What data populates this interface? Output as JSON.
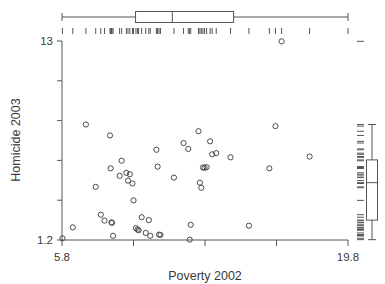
{
  "chart_data": {
    "type": "scatter",
    "title": "",
    "xlabel": "Poverty 2002",
    "ylabel": "Homicide 2003",
    "xlim": [
      5.8,
      19.8
    ],
    "ylim": [
      1.2,
      13.0
    ],
    "xticklabels": [
      "5.8",
      "19.8"
    ],
    "yticklabels": [
      "13",
      "1.2"
    ],
    "grid": false,
    "legend": null,
    "marker": "open-circle",
    "marker_color": "#4a4a4a",
    "points": [
      {
        "x": 5.82,
        "y": 1.3
      },
      {
        "x": 6.33,
        "y": 1.95
      },
      {
        "x": 6.97,
        "y": 8.05
      },
      {
        "x": 7.45,
        "y": 4.35
      },
      {
        "x": 7.7,
        "y": 2.7
      },
      {
        "x": 7.88,
        "y": 2.35
      },
      {
        "x": 8.15,
        "y": 7.4
      },
      {
        "x": 8.18,
        "y": 5.45
      },
      {
        "x": 8.22,
        "y": 2.25
      },
      {
        "x": 8.25,
        "y": 2.22
      },
      {
        "x": 8.3,
        "y": 1.45
      },
      {
        "x": 8.62,
        "y": 5.0
      },
      {
        "x": 8.72,
        "y": 5.9
      },
      {
        "x": 8.95,
        "y": 5.18
      },
      {
        "x": 9.03,
        "y": 4.72
      },
      {
        "x": 9.12,
        "y": 5.1
      },
      {
        "x": 9.25,
        "y": 4.55
      },
      {
        "x": 9.3,
        "y": 3.55
      },
      {
        "x": 9.42,
        "y": 1.9
      },
      {
        "x": 9.5,
        "y": 1.82
      },
      {
        "x": 9.55,
        "y": 1.78
      },
      {
        "x": 9.7,
        "y": 2.55
      },
      {
        "x": 9.9,
        "y": 1.62
      },
      {
        "x": 10.05,
        "y": 2.38
      },
      {
        "x": 10.12,
        "y": 1.45
      },
      {
        "x": 10.42,
        "y": 6.55
      },
      {
        "x": 10.48,
        "y": 5.55
      },
      {
        "x": 10.55,
        "y": 1.52
      },
      {
        "x": 10.62,
        "y": 1.5
      },
      {
        "x": 11.28,
        "y": 4.9
      },
      {
        "x": 11.75,
        "y": 6.95
      },
      {
        "x": 11.98,
        "y": 6.6
      },
      {
        "x": 12.05,
        "y": 1.22
      },
      {
        "x": 12.1,
        "y": 2.1
      },
      {
        "x": 12.48,
        "y": 7.65
      },
      {
        "x": 12.55,
        "y": 4.6
      },
      {
        "x": 12.62,
        "y": 4.3
      },
      {
        "x": 12.7,
        "y": 5.5
      },
      {
        "x": 12.78,
        "y": 5.48
      },
      {
        "x": 12.88,
        "y": 5.52
      },
      {
        "x": 13.05,
        "y": 7.05
      },
      {
        "x": 13.15,
        "y": 6.28
      },
      {
        "x": 13.35,
        "y": 6.35
      },
      {
        "x": 14.05,
        "y": 6.1
      },
      {
        "x": 14.95,
        "y": 2.05
      },
      {
        "x": 15.95,
        "y": 5.45
      },
      {
        "x": 16.25,
        "y": 7.95
      },
      {
        "x": 16.55,
        "y": 12.98
      },
      {
        "x": 17.92,
        "y": 6.15
      }
    ],
    "x_marginal_boxplot": {
      "orientation": "horizontal",
      "whisker_low": 5.8,
      "q1": 9.4,
      "median": 11.2,
      "q3": 14.2,
      "whisker_high": 19.8,
      "rug_values": [
        5.82,
        6.33,
        6.97,
        7.45,
        7.7,
        7.88,
        8.15,
        8.18,
        8.22,
        8.25,
        8.3,
        8.62,
        8.72,
        8.95,
        9.03,
        9.12,
        9.25,
        9.3,
        9.42,
        9.5,
        9.55,
        9.7,
        9.9,
        10.05,
        10.12,
        10.42,
        10.48,
        10.55,
        10.62,
        11.28,
        11.75,
        11.98,
        12.05,
        12.1,
        12.48,
        12.55,
        12.62,
        12.7,
        12.78,
        12.88,
        13.05,
        13.15,
        13.35,
        14.05,
        14.95,
        15.95,
        16.25,
        16.55,
        17.92,
        19.8
      ]
    },
    "y_marginal_boxplot": {
      "orientation": "vertical",
      "whisker_low": 1.22,
      "q1": 2.38,
      "median": 4.6,
      "q3": 5.95,
      "whisker_high": 8.05,
      "rug_values": [
        1.22,
        1.3,
        1.45,
        1.45,
        1.5,
        1.52,
        1.62,
        1.78,
        1.82,
        1.9,
        1.95,
        2.05,
        2.1,
        2.22,
        2.25,
        2.35,
        2.38,
        2.55,
        2.7,
        3.55,
        4.3,
        4.35,
        4.55,
        4.6,
        4.72,
        4.9,
        5.0,
        5.1,
        5.18,
        5.45,
        5.45,
        5.48,
        5.5,
        5.52,
        5.55,
        5.9,
        5.95,
        6.1,
        6.15,
        6.28,
        6.35,
        6.55,
        6.6,
        6.95,
        7.05,
        7.4,
        7.65,
        7.95,
        8.05,
        12.98
      ]
    }
  },
  "axes": {
    "x_label": "Poverty 2002",
    "y_label": "Homicide 2003",
    "x_tick_min": "5.8",
    "x_tick_max": "19.8",
    "y_tick_min": "1.2",
    "y_tick_max": "13"
  },
  "colors": {
    "axis": "#555555",
    "marker": "#4a4a4a",
    "text": "#3a3a3a",
    "background": "#ffffff"
  }
}
